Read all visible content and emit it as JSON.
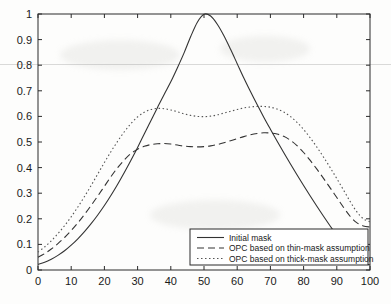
{
  "chart_data": {
    "type": "line",
    "title": "",
    "xlabel": "",
    "ylabel": "",
    "xlim": [
      0,
      100
    ],
    "ylim": [
      0,
      1
    ],
    "grid": false,
    "legend_position": "lower-right",
    "x_ticks": [
      "0",
      "10",
      "20",
      "30",
      "40",
      "50",
      "60",
      "70",
      "80",
      "90",
      "100"
    ],
    "y_ticks": [
      "0",
      "0.1",
      "0.2",
      "0.3",
      "0.4",
      "0.5",
      "0.6",
      "0.7",
      "0.8",
      "0.9",
      "1"
    ],
    "x": [
      0,
      2,
      4,
      6,
      8,
      10,
      12,
      14,
      16,
      18,
      20,
      22,
      24,
      26,
      28,
      30,
      32,
      34,
      36,
      38,
      40,
      42,
      44,
      46,
      48,
      50,
      52,
      54,
      56,
      58,
      60,
      62,
      64,
      66,
      68,
      70,
      72,
      74,
      76,
      78,
      80,
      82,
      84,
      86,
      88,
      90,
      92,
      94,
      96,
      98,
      100
    ],
    "series": [
      {
        "name": "Initial mask",
        "style": "solid",
        "color": "#333333",
        "values": [
          0.022,
          0.03,
          0.042,
          0.057,
          0.075,
          0.097,
          0.122,
          0.15,
          0.181,
          0.215,
          0.252,
          0.292,
          0.335,
          0.381,
          0.429,
          0.479,
          0.531,
          0.583,
          0.635,
          0.686,
          0.735,
          0.79,
          0.848,
          0.912,
          0.968,
          0.999,
          0.992,
          0.96,
          0.915,
          0.862,
          0.806,
          0.75,
          0.697,
          0.646,
          0.597,
          0.55,
          0.504,
          0.459,
          0.415,
          0.372,
          0.33,
          0.289,
          0.249,
          0.21,
          0.172,
          0.135,
          0.099,
          0.064,
          0.04,
          0.026,
          0.02
        ]
      },
      {
        "name": "OPC based on thin-mask assumption",
        "style": "dashed",
        "color": "#333333",
        "values": [
          0.05,
          0.064,
          0.082,
          0.103,
          0.127,
          0.154,
          0.184,
          0.217,
          0.252,
          0.289,
          0.327,
          0.365,
          0.4,
          0.43,
          0.455,
          0.472,
          0.483,
          0.49,
          0.493,
          0.494,
          0.492,
          0.488,
          0.484,
          0.482,
          0.481,
          0.482,
          0.485,
          0.49,
          0.497,
          0.505,
          0.513,
          0.521,
          0.528,
          0.533,
          0.536,
          0.535,
          0.531,
          0.522,
          0.507,
          0.486,
          0.459,
          0.428,
          0.394,
          0.358,
          0.321,
          0.283,
          0.245,
          0.21,
          0.185,
          0.172,
          0.168
        ]
      },
      {
        "name": "OPC based on thick-mask assumption",
        "style": "dotted",
        "color": "#555555",
        "values": [
          0.07,
          0.09,
          0.114,
          0.142,
          0.173,
          0.208,
          0.246,
          0.287,
          0.33,
          0.375,
          0.42,
          0.463,
          0.503,
          0.54,
          0.572,
          0.598,
          0.616,
          0.627,
          0.631,
          0.63,
          0.625,
          0.618,
          0.61,
          0.604,
          0.6,
          0.599,
          0.601,
          0.606,
          0.613,
          0.62,
          0.627,
          0.633,
          0.637,
          0.639,
          0.639,
          0.636,
          0.629,
          0.617,
          0.6,
          0.577,
          0.549,
          0.516,
          0.48,
          0.441,
          0.4,
          0.357,
          0.313,
          0.268,
          0.228,
          0.2,
          0.188
        ]
      }
    ],
    "legend_entries": [
      "Initial mask",
      "OPC based on thin-mask assumption",
      "OPC based on thick-mask assumption"
    ]
  }
}
